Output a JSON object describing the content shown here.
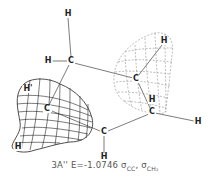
{
  "figure": {
    "caption": {
      "state": "3A''",
      "energy": "E=-1.0746",
      "orbital1": "σ",
      "orbital1_sub": "CC",
      "separator": ",",
      "orbital2": "σ",
      "orbital2_sub": "CH₂"
    },
    "atoms": [
      {
        "label": "H",
        "x": 68,
        "y": 14
      },
      {
        "label": "H",
        "x": 48,
        "y": 61
      },
      {
        "label": "C",
        "x": 71,
        "y": 61
      },
      {
        "label": "C",
        "x": 136,
        "y": 79
      },
      {
        "label": "H",
        "x": 164,
        "y": 41
      },
      {
        "label": "H",
        "x": 152,
        "y": 100
      },
      {
        "label": "C",
        "x": 152,
        "y": 112
      },
      {
        "label": "H",
        "x": 198,
        "y": 122
      },
      {
        "label": "C",
        "x": 104,
        "y": 132
      },
      {
        "label": "H",
        "x": 104,
        "y": 157
      },
      {
        "label": "C",
        "x": 47,
        "y": 109
      },
      {
        "label": "H'",
        "x": 28,
        "y": 89
      },
      {
        "label": "H",
        "x": 18,
        "y": 147
      }
    ],
    "colors": {
      "line": "#333333",
      "mesh": "#222222",
      "dashed_mesh": "#888888"
    }
  }
}
